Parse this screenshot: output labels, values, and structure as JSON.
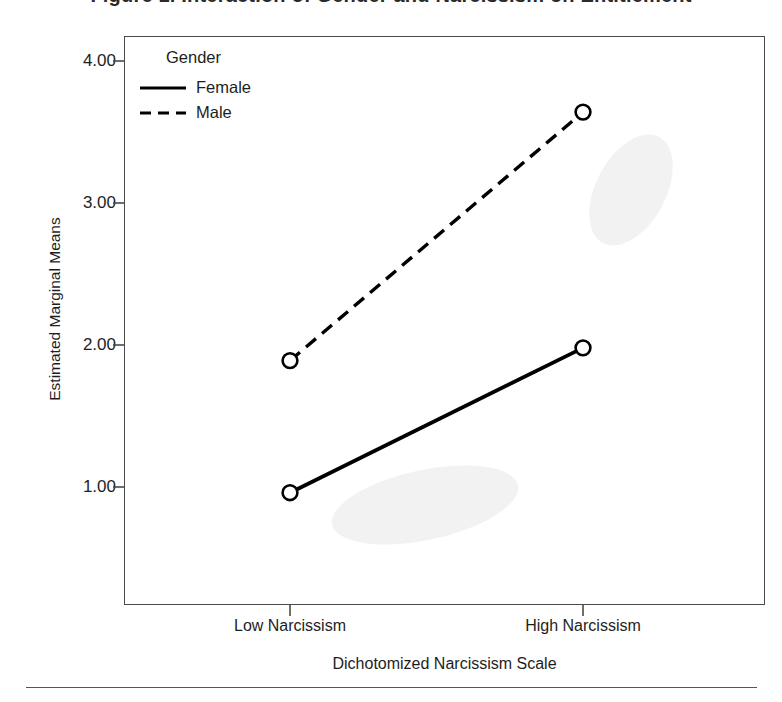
{
  "figure": {
    "title_cropped": "Figure 1. Interaction of Gender and Narcissism on Entitlement",
    "y_axis_title": "Estimated Marginal Means",
    "x_axis_title": "Dichotomized Narcissism Scale",
    "legend_title": "Gender"
  },
  "chart_data": {
    "type": "line",
    "title": "",
    "xlabel": "Dichotomized Narcissism Scale",
    "ylabel": "Estimated Marginal Means",
    "categories": [
      "Low Narcissism",
      "High Narcissism"
    ],
    "series": [
      {
        "name": "Female",
        "values": [
          0.96,
          1.98
        ],
        "style": "solid",
        "marker": "open-circle",
        "color": "#000000"
      },
      {
        "name": "Male",
        "values": [
          1.89,
          3.64
        ],
        "style": "dashed",
        "marker": "open-circle",
        "color": "#000000"
      }
    ],
    "yticks": [
      "1.00",
      "2.00",
      "3.00",
      "4.00"
    ],
    "ytick_values": [
      1.0,
      2.0,
      3.0,
      4.0
    ],
    "ylim": [
      0.17,
      4.17
    ],
    "grid": false,
    "legend_position": "inside-top-left",
    "legend_title": "Gender"
  },
  "colors": {
    "line": "#000000",
    "frame": "#4a4a4a",
    "text": "#1e1e1e",
    "rule": "#555555"
  }
}
